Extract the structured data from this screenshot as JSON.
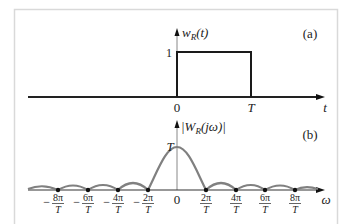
{
  "panel_a": {
    "tag": "(a)",
    "ylabel_main": "w",
    "ylabel_sub": "R",
    "ylabel_arg": "(t)",
    "level_label": "1",
    "tick_labels": [
      "0",
      "T"
    ],
    "xlabel": "t"
  },
  "panel_b": {
    "tag": "(b)",
    "ylabel_pre": "|W",
    "ylabel_sub": "R",
    "ylabel_arg": "(jω)|",
    "peak_label": "T",
    "center_label": "0",
    "xlabel": "ω",
    "tick_labels": [
      {
        "num": "8π",
        "den": "T",
        "sign": "−"
      },
      {
        "num": "6π",
        "den": "T",
        "sign": "−"
      },
      {
        "num": "4π",
        "den": "T",
        "sign": "−"
      },
      {
        "num": "2π",
        "den": "T",
        "sign": "−"
      },
      {
        "num": "2π",
        "den": "T",
        "sign": ""
      },
      {
        "num": "4π",
        "den": "T",
        "sign": ""
      },
      {
        "num": "6π",
        "den": "T",
        "sign": ""
      },
      {
        "num": "8π",
        "den": "T",
        "sign": ""
      }
    ]
  },
  "colors": {
    "frame": "#d9d9d9",
    "axis": "#222222",
    "pulse": "#1a1a1a",
    "spectrum": "#808080",
    "thin_axis": "#888888"
  }
}
